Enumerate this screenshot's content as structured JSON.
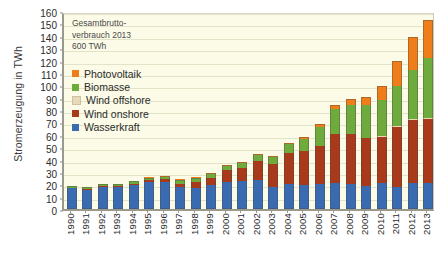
{
  "chart_data": {
    "type": "bar",
    "subtype": "stacked-bar",
    "title": "",
    "xlabel": "",
    "ylabel": "Stromerzeugung in TWh",
    "ylim": [
      0,
      160
    ],
    "ytick_step": 10,
    "yticks": [
      0,
      10,
      20,
      30,
      40,
      50,
      60,
      70,
      80,
      90,
      100,
      110,
      120,
      130,
      140,
      150,
      160
    ],
    "grid": true,
    "legend_position": "upper-left-inside",
    "annotation": "Gesamtbrutto-\nverbrauch 2013\n600 TWh",
    "categories": [
      "1990",
      "1991",
      "1992",
      "1993",
      "1994",
      "1995",
      "1996",
      "1997",
      "1998",
      "1999",
      "2000",
      "2001",
      "2002",
      "2003",
      "2004",
      "2005",
      "2006",
      "2007",
      "2008",
      "2009",
      "2010",
      "2011",
      "2012",
      "2013"
    ],
    "series": [
      {
        "name": "Wasserkraft",
        "color": "#3a6bb0",
        "values": [
          17.0,
          15.9,
          18.1,
          18.2,
          19.5,
          21.6,
          21.9,
          17.4,
          17.2,
          19.6,
          21.7,
          22.7,
          23.1,
          17.7,
          19.9,
          19.6,
          20.0,
          21.2,
          20.4,
          19.0,
          20.9,
          17.5,
          21.2,
          21.2
        ]
      },
      {
        "name": "Wind onshore",
        "color": "#a8391b",
        "values": [
          0.1,
          0.2,
          0.3,
          0.6,
          0.9,
          1.5,
          2.0,
          3.0,
          4.6,
          5.5,
          9.5,
          10.5,
          15.8,
          18.7,
          25.5,
          27.2,
          30.7,
          39.7,
          40.6,
          38.6,
          37.8,
          48.9,
          50.7,
          51.7
        ]
      },
      {
        "name": "Wind offshore",
        "color": "#e8d9b8",
        "values": [
          0,
          0,
          0,
          0,
          0,
          0,
          0,
          0,
          0,
          0,
          0,
          0,
          0,
          0,
          0,
          0,
          0,
          0,
          0,
          0,
          0.2,
          0.6,
          0.7,
          0.9
        ]
      },
      {
        "name": "Biomasse",
        "color": "#6fab3c",
        "values": [
          1.4,
          1.5,
          1.6,
          1.8,
          2.0,
          2.3,
          2.6,
          3.0,
          3.4,
          3.8,
          4.1,
          4.4,
          5.0,
          6.1,
          7.5,
          10.0,
          15.4,
          19.8,
          23.4,
          26.5,
          29.1,
          32.8,
          39.7,
          47.9
        ]
      },
      {
        "name": "Photovoltaik",
        "color": "#ef7d1a",
        "values": [
          0,
          0,
          0,
          0,
          0,
          0.01,
          0.02,
          0.03,
          0.04,
          0.06,
          0.06,
          0.08,
          0.16,
          0.3,
          0.6,
          1.3,
          2.2,
          3.1,
          4.4,
          6.6,
          11.7,
          19.6,
          26.4,
          31.0
        ]
      }
    ],
    "series_order_bottom_to_top": [
      "Wasserkraft",
      "Wind onshore",
      "Wind offshore",
      "Biomasse",
      "Photovoltaik"
    ],
    "totals": [
      18.5,
      17.6,
      20.0,
      20.6,
      22.4,
      25.4,
      26.5,
      23.4,
      25.2,
      29.0,
      35.4,
      37.7,
      44.1,
      42.8,
      53.5,
      58.1,
      68.3,
      83.8,
      88.8,
      90.7,
      99.7,
      119.4,
      138.7,
      152.7
    ]
  },
  "legend": {
    "items": [
      {
        "label": "Photovoltaik",
        "color": "#ef7d1a"
      },
      {
        "label": "Biomasse",
        "color": "#6fab3c"
      },
      {
        "label": "Wind offshore",
        "color": "#e8d9b8"
      },
      {
        "label": "Wind onshore",
        "color": "#a8391b"
      },
      {
        "label": "Wasserkraft",
        "color": "#3a6bb0"
      }
    ]
  },
  "theme": {
    "plot_background": "#fbfbe8",
    "gridline_color": "#e3e3c8",
    "axis_color": "#9a9a8c",
    "text_color": "#2b2b2b"
  }
}
